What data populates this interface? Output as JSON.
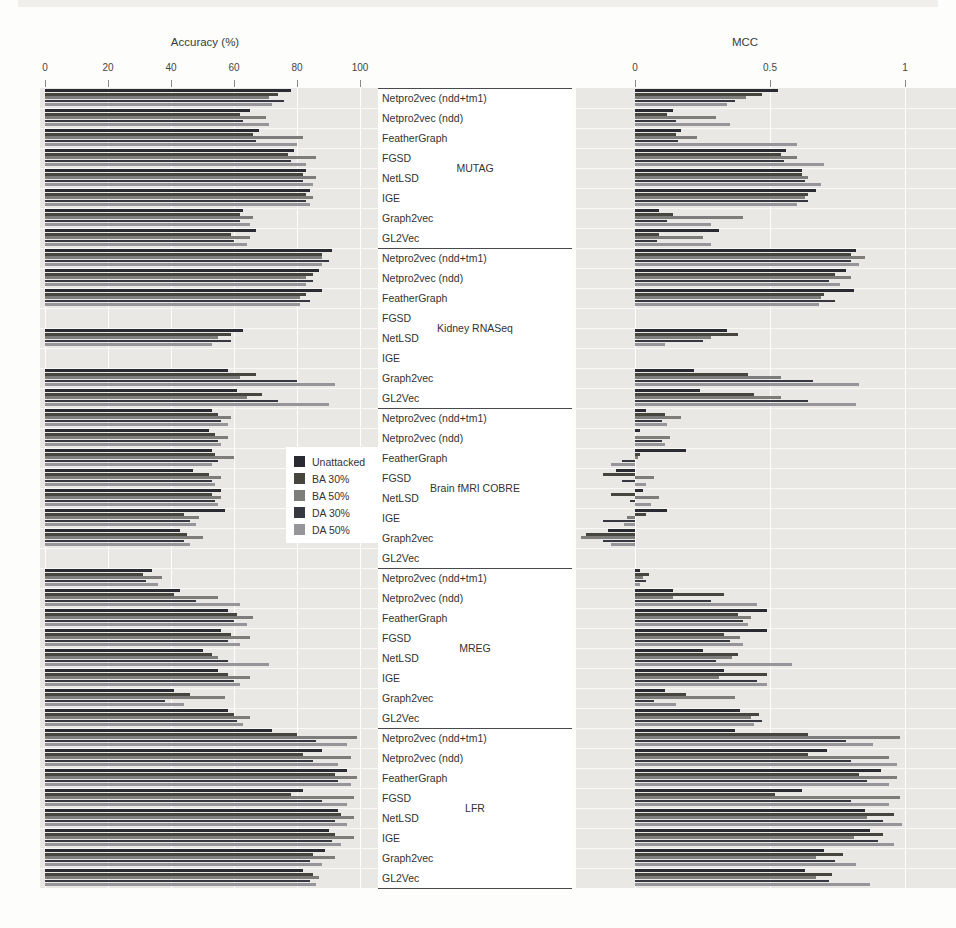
{
  "figure": {
    "left_title": "Accuracy (%)",
    "right_title": "MCC"
  },
  "legend": {
    "items": [
      {
        "label": "Unattacked",
        "color": "#2a2a32"
      },
      {
        "label": "BA 30%",
        "color": "#46463e"
      },
      {
        "label": "BA 50%",
        "color": "#7d7d7b"
      },
      {
        "label": "DA 30%",
        "color": "#383842"
      },
      {
        "label": "DA 50%",
        "color": "#95959a"
      }
    ]
  },
  "chart_data": [
    {
      "type": "bar",
      "orientation": "horizontal",
      "title": "Accuracy (%)",
      "xlim": [
        0,
        100
      ],
      "ticks": [
        "0",
        "20",
        "40",
        "60",
        "80",
        "100"
      ],
      "tick_values": [
        0,
        20,
        40,
        60,
        80,
        100
      ],
      "grid": true,
      "series_labels": [
        "Unattacked",
        "BA 30%",
        "BA 50%",
        "DA 30%",
        "DA 50%"
      ],
      "groups": [
        {
          "dataset": "MUTAG",
          "methods": [
            {
              "label": "Netpro2vec (ndd+tm1)",
              "values": [
                78,
                74,
                71,
                76,
                72
              ]
            },
            {
              "label": "Netpro2vec (ndd)",
              "values": [
                65,
                62,
                70,
                63,
                71
              ]
            },
            {
              "label": "FeatherGraph",
              "values": [
                68,
                66,
                82,
                67,
                80
              ]
            },
            {
              "label": "FGSD",
              "values": [
                79,
                77,
                86,
                78,
                83
              ]
            },
            {
              "label": "NetLSD",
              "values": [
                83,
                82,
                86,
                82,
                85
              ]
            },
            {
              "label": "IGE",
              "values": [
                84,
                83,
                85,
                83,
                84
              ]
            },
            {
              "label": "Graph2vec",
              "values": [
                63,
                62,
                66,
                62,
                65
              ]
            },
            {
              "label": "GL2Vec",
              "values": [
                67,
                59,
                65,
                60,
                64
              ]
            }
          ]
        },
        {
          "dataset": "Kidney RNASeq",
          "methods": [
            {
              "label": "Netpro2vec (ndd+tm1)",
              "values": [
                91,
                88,
                88,
                90,
                88
              ]
            },
            {
              "label": "Netpro2vec (ndd)",
              "values": [
                87,
                85,
                83,
                85,
                83
              ]
            },
            {
              "label": "FeatherGraph",
              "values": [
                88,
                83,
                81,
                84,
                81
              ]
            },
            {
              "label": "FGSD",
              "values": [
                0,
                0,
                0,
                0,
                0
              ]
            },
            {
              "label": "NetLSD",
              "values": [
                63,
                59,
                55,
                59,
                53
              ]
            },
            {
              "label": "IGE",
              "values": [
                0,
                0,
                0,
                0,
                0
              ]
            },
            {
              "label": "Graph2vec",
              "values": [
                58,
                67,
                62,
                80,
                92
              ]
            },
            {
              "label": "GL2Vec",
              "values": [
                61,
                69,
                64,
                74,
                90
              ]
            }
          ]
        },
        {
          "dataset": "Brain fMRI COBRE",
          "methods": [
            {
              "label": "Netpro2vec (ndd+tm1)",
              "values": [
                53,
                55,
                59,
                56,
                58
              ]
            },
            {
              "label": "Netpro2vec (ndd)",
              "values": [
                52,
                54,
                58,
                55,
                56
              ]
            },
            {
              "label": "FeatherGraph",
              "values": [
                53,
                54,
                60,
                55,
                53
              ]
            },
            {
              "label": "FGSD",
              "values": [
                47,
                52,
                56,
                53,
                54
              ]
            },
            {
              "label": "NetLSD",
              "values": [
                56,
                53,
                56,
                54,
                55
              ]
            },
            {
              "label": "IGE",
              "values": [
                57,
                44,
                49,
                46,
                48
              ]
            },
            {
              "label": "Graph2vec",
              "values": [
                43,
                45,
                50,
                44,
                46
              ]
            },
            {
              "label": "GL2Vec",
              "values": [
                0,
                0,
                0,
                0,
                0
              ]
            }
          ]
        },
        {
          "dataset": "MREG",
          "methods": [
            {
              "label": "Netpro2vec (ndd+tm1)",
              "values": [
                34,
                31,
                37,
                32,
                36
              ]
            },
            {
              "label": "Netpro2vec (ndd)",
              "values": [
                43,
                41,
                55,
                48,
                62
              ]
            },
            {
              "label": "FeatherGraph",
              "values": [
                58,
                61,
                66,
                60,
                64
              ]
            },
            {
              "label": "FGSD",
              "values": [
                56,
                59,
                65,
                58,
                62
              ]
            },
            {
              "label": "NetLSD",
              "values": [
                50,
                53,
                55,
                58,
                71
              ]
            },
            {
              "label": "IGE",
              "values": [
                55,
                58,
                65,
                60,
                62
              ]
            },
            {
              "label": "Graph2vec",
              "values": [
                41,
                46,
                57,
                38,
                44
              ]
            },
            {
              "label": "GL2Vec",
              "values": [
                58,
                60,
                65,
                61,
                63
              ]
            }
          ]
        },
        {
          "dataset": "LFR",
          "methods": [
            {
              "label": "Netpro2vec (ndd+tm1)",
              "values": [
                72,
                80,
                99,
                86,
                96
              ]
            },
            {
              "label": "Netpro2vec (ndd)",
              "values": [
                88,
                82,
                97,
                85,
                93
              ]
            },
            {
              "label": "FeatherGraph",
              "values": [
                96,
                92,
                99,
                93,
                97
              ]
            },
            {
              "label": "FGSD",
              "values": [
                82,
                78,
                98,
                88,
                96
              ]
            },
            {
              "label": "NetLSD",
              "values": [
                93,
                94,
                98,
                92,
                96
              ]
            },
            {
              "label": "IGE",
              "values": [
                90,
                92,
                98,
                91,
                94
              ]
            },
            {
              "label": "Graph2vec",
              "values": [
                89,
                85,
                92,
                84,
                88
              ]
            },
            {
              "label": "GL2Vec",
              "values": [
                82,
                85,
                87,
                84,
                86
              ]
            }
          ]
        }
      ]
    },
    {
      "type": "bar",
      "orientation": "horizontal",
      "title": "MCC",
      "xlim": [
        -0.25,
        1.05
      ],
      "ticks": [
        "0",
        "0.5",
        "1"
      ],
      "tick_values": [
        0,
        0.5,
        1
      ],
      "grid": true,
      "series_labels": [
        "Unattacked",
        "BA 30%",
        "BA 50%",
        "DA 30%",
        "DA 50%"
      ],
      "groups": [
        {
          "dataset": "MUTAG",
          "methods": [
            {
              "label": "Netpro2vec (ndd+tm1)",
              "values": [
                0.53,
                0.47,
                0.41,
                0.37,
                0.34
              ]
            },
            {
              "label": "Netpro2vec (ndd)",
              "values": [
                0.14,
                0.12,
                0.3,
                0.15,
                0.35
              ]
            },
            {
              "label": "FeatherGraph",
              "values": [
                0.17,
                0.15,
                0.23,
                0.16,
                0.6
              ]
            },
            {
              "label": "FGSD",
              "values": [
                0.56,
                0.54,
                0.6,
                0.55,
                0.7
              ]
            },
            {
              "label": "NetLSD",
              "values": [
                0.62,
                0.62,
                0.64,
                0.63,
                0.69
              ]
            },
            {
              "label": "IGE",
              "values": [
                0.67,
                0.64,
                0.63,
                0.64,
                0.6
              ]
            },
            {
              "label": "Graph2vec",
              "values": [
                0.09,
                0.14,
                0.4,
                0.12,
                0.28
              ]
            },
            {
              "label": "GL2Vec",
              "values": [
                0.31,
                0.09,
                0.25,
                0.08,
                0.28
              ]
            }
          ]
        },
        {
          "dataset": "Kidney RNASeq",
          "methods": [
            {
              "label": "Netpro2vec (ndd+tm1)",
              "values": [
                0.82,
                0.8,
                0.85,
                0.8,
                0.83
              ]
            },
            {
              "label": "Netpro2vec (ndd)",
              "values": [
                0.78,
                0.74,
                0.8,
                0.72,
                0.76
              ]
            },
            {
              "label": "FeatherGraph",
              "values": [
                0.81,
                0.7,
                0.69,
                0.74,
                0.68
              ]
            },
            {
              "label": "FGSD",
              "values": [
                0,
                0,
                0,
                0,
                0
              ]
            },
            {
              "label": "NetLSD",
              "values": [
                0.34,
                0.38,
                0.28,
                0.25,
                0.11
              ]
            },
            {
              "label": "IGE",
              "values": [
                0,
                0,
                0,
                0,
                0
              ]
            },
            {
              "label": "Graph2vec",
              "values": [
                0.22,
                0.42,
                0.54,
                0.66,
                0.83
              ]
            },
            {
              "label": "GL2Vec",
              "values": [
                0.24,
                0.44,
                0.54,
                0.64,
                0.82
              ]
            }
          ]
        },
        {
          "dataset": "Brain fMRI COBRE",
          "methods": [
            {
              "label": "Netpro2vec (ndd+tm1)",
              "values": [
                0.04,
                0.11,
                0.17,
                0.1,
                0.12
              ]
            },
            {
              "label": "Netpro2vec (ndd)",
              "values": [
                0.02,
                0.0,
                0.13,
                0.1,
                0.11
              ]
            },
            {
              "label": "FeatherGraph",
              "values": [
                0.19,
                0.02,
                0.01,
                -0.05,
                -0.09
              ]
            },
            {
              "label": "FGSD",
              "values": [
                -0.07,
                -0.12,
                0.07,
                -0.05,
                0.04
              ]
            },
            {
              "label": "NetLSD",
              "values": [
                0.03,
                -0.09,
                0.09,
                -0.02,
                0.06
              ]
            },
            {
              "label": "IGE",
              "values": [
                0.12,
                0.04,
                -0.03,
                -0.12,
                -0.04
              ]
            },
            {
              "label": "Graph2vec",
              "values": [
                -0.1,
                -0.18,
                -0.2,
                -0.12,
                -0.09
              ]
            },
            {
              "label": "GL2Vec",
              "values": [
                0,
                0,
                0,
                0,
                0
              ]
            }
          ]
        },
        {
          "dataset": "MREG",
          "methods": [
            {
              "label": "Netpro2vec (ndd+tm1)",
              "values": [
                0.02,
                0.05,
                0.03,
                0.04,
                0.02
              ]
            },
            {
              "label": "Netpro2vec (ndd)",
              "values": [
                0.14,
                0.33,
                0.14,
                0.28,
                0.45
              ]
            },
            {
              "label": "FeatherGraph",
              "values": [
                0.49,
                0.38,
                0.43,
                0.4,
                0.42
              ]
            },
            {
              "label": "FGSD",
              "values": [
                0.49,
                0.33,
                0.39,
                0.35,
                0.4
              ]
            },
            {
              "label": "NetLSD",
              "values": [
                0.25,
                0.38,
                0.36,
                0.3,
                0.58
              ]
            },
            {
              "label": "IGE",
              "values": [
                0.33,
                0.49,
                0.31,
                0.45,
                0.49
              ]
            },
            {
              "label": "Graph2vec",
              "values": [
                0.11,
                0.19,
                0.37,
                0.07,
                0.15
              ]
            },
            {
              "label": "GL2Vec",
              "values": [
                0.39,
                0.46,
                0.43,
                0.47,
                0.44
              ]
            }
          ]
        },
        {
          "dataset": "LFR",
          "methods": [
            {
              "label": "Netpro2vec (ndd+tm1)",
              "values": [
                0.37,
                0.64,
                0.98,
                0.78,
                0.88
              ]
            },
            {
              "label": "Netpro2vec (ndd)",
              "values": [
                0.71,
                0.64,
                0.94,
                0.8,
                0.97
              ]
            },
            {
              "label": "FeatherGraph",
              "values": [
                0.91,
                0.83,
                0.97,
                0.86,
                0.94
              ]
            },
            {
              "label": "FGSD",
              "values": [
                0.62,
                0.52,
                0.98,
                0.8,
                0.94
              ]
            },
            {
              "label": "NetLSD",
              "values": [
                0.85,
                0.96,
                0.86,
                0.92,
                0.99
              ]
            },
            {
              "label": "IGE",
              "values": [
                0.87,
                0.92,
                0.81,
                0.9,
                0.96
              ]
            },
            {
              "label": "Graph2vec",
              "values": [
                0.7,
                0.77,
                0.67,
                0.74,
                0.82
              ]
            },
            {
              "label": "GL2Vec",
              "values": [
                0.63,
                0.73,
                0.67,
                0.72,
                0.87
              ]
            }
          ]
        }
      ]
    }
  ]
}
